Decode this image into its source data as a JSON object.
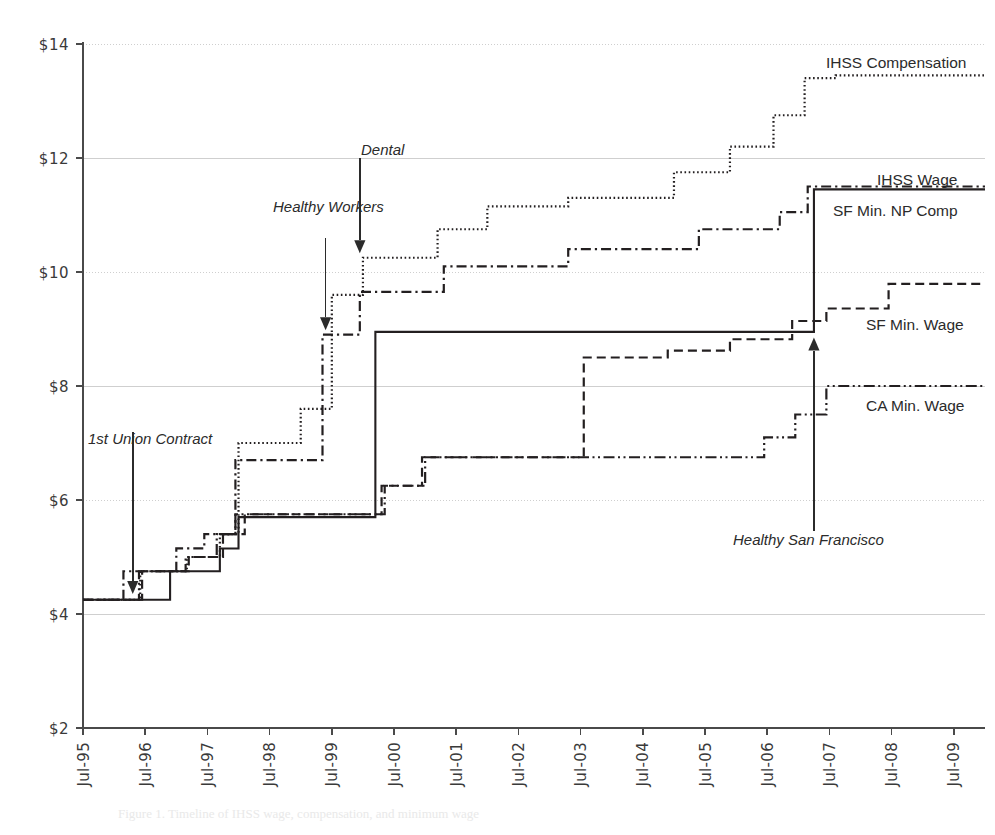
{
  "chart_data": {
    "type": "line",
    "title": "",
    "subtitle": "",
    "xlabel": "",
    "ylabel": "",
    "grid": true,
    "legend_position": "right-inline",
    "xlim": [
      "Jul-95",
      "Jul-10"
    ],
    "ylim": [
      2,
      14
    ],
    "ytick_labels": [
      "$14",
      "$12",
      "$10",
      "$8",
      "$6",
      "$4",
      "$2"
    ],
    "ytick_values": [
      14,
      12,
      10,
      8,
      6,
      4,
      2
    ],
    "xtick_labels": [
      "Jul-95",
      "Jul-96",
      "Jul-97",
      "Jul-98",
      "Jul-99",
      "Jul-00",
      "Jul-01",
      "Jul-02",
      "Jul-03",
      "Jul-04",
      "Jul-05",
      "Jul-06",
      "Jul-07",
      "Jul-08",
      "Jul-09"
    ],
    "xtick_values": [
      1995.5,
      1996.5,
      1997.5,
      1998.5,
      1999.5,
      2000.5,
      2001.5,
      2002.5,
      2003.5,
      2004.5,
      2005.5,
      2006.5,
      2007.5,
      2008.5,
      2009.5
    ],
    "series": [
      {
        "name": "IHSS Compensation",
        "label": "IHSS Compensation",
        "dash": "dotted",
        "color": "#231f20",
        "points": [
          [
            1995.5,
            4.25
          ],
          [
            1996.42,
            4.25
          ],
          [
            1996.42,
            4.75
          ],
          [
            1997.17,
            4.75
          ],
          [
            1997.17,
            5.0
          ],
          [
            1997.7,
            5.0
          ],
          [
            1997.7,
            5.4
          ],
          [
            1998.0,
            5.4
          ],
          [
            1998.0,
            7.0
          ],
          [
            1999.0,
            7.0
          ],
          [
            1999.0,
            7.6
          ],
          [
            1999.5,
            7.6
          ],
          [
            1999.5,
            9.6
          ],
          [
            2000.0,
            9.6
          ],
          [
            2000.0,
            10.25
          ],
          [
            2001.2,
            10.25
          ],
          [
            2001.2,
            10.75
          ],
          [
            2002.0,
            10.75
          ],
          [
            2002.0,
            11.15
          ],
          [
            2003.3,
            11.15
          ],
          [
            2003.3,
            11.3
          ],
          [
            2005.0,
            11.3
          ],
          [
            2005.0,
            11.75
          ],
          [
            2005.9,
            11.75
          ],
          [
            2005.9,
            12.2
          ],
          [
            2006.6,
            12.2
          ],
          [
            2006.6,
            12.75
          ],
          [
            2007.1,
            12.75
          ],
          [
            2007.1,
            13.4
          ],
          [
            2007.6,
            13.4
          ],
          [
            2007.6,
            13.45
          ],
          [
            2010.0,
            13.45
          ]
        ]
      },
      {
        "name": "IHSS Wage",
        "label": "IHSS Wage",
        "dash": "solid",
        "color": "#231f20",
        "points": [
          [
            1995.5,
            4.25
          ],
          [
            1996.9,
            4.25
          ],
          [
            1996.9,
            4.75
          ],
          [
            1997.7,
            4.75
          ],
          [
            1997.7,
            5.15
          ],
          [
            1998.0,
            5.15
          ],
          [
            1998.0,
            5.7
          ],
          [
            2000.2,
            5.7
          ],
          [
            2000.2,
            8.95
          ],
          [
            2007.25,
            8.95
          ],
          [
            2007.25,
            11.45
          ],
          [
            2010.0,
            11.45
          ]
        ]
      },
      {
        "name": "SF Min. NP Comp",
        "label": "SF Min. NP Comp",
        "dash": "dashdot",
        "color": "#231f20",
        "points": [
          [
            1995.5,
            4.25
          ],
          [
            1996.15,
            4.25
          ],
          [
            1996.15,
            4.75
          ],
          [
            1997.0,
            4.75
          ],
          [
            1997.0,
            5.15
          ],
          [
            1997.45,
            5.15
          ],
          [
            1997.45,
            5.4
          ],
          [
            1997.95,
            5.4
          ],
          [
            1997.95,
            6.7
          ],
          [
            1999.35,
            6.7
          ],
          [
            1999.35,
            8.9
          ],
          [
            1999.95,
            8.9
          ],
          [
            1999.95,
            9.65
          ],
          [
            2001.3,
            9.65
          ],
          [
            2001.3,
            10.1
          ],
          [
            2003.3,
            10.1
          ],
          [
            2003.3,
            10.4
          ],
          [
            2005.4,
            10.4
          ],
          [
            2005.4,
            10.75
          ],
          [
            2006.7,
            10.75
          ],
          [
            2006.7,
            11.05
          ],
          [
            2007.15,
            11.05
          ],
          [
            2007.15,
            11.5
          ],
          [
            2010.0,
            11.5
          ]
        ]
      },
      {
        "name": "SF Min. Wage",
        "label": "SF Min. Wage",
        "dash": "dashed",
        "color": "#231f20",
        "points": [
          [
            1995.5,
            4.25
          ],
          [
            1996.45,
            4.25
          ],
          [
            1996.45,
            4.75
          ],
          [
            1997.2,
            4.75
          ],
          [
            1997.2,
            5.0
          ],
          [
            1997.75,
            5.0
          ],
          [
            1997.75,
            5.4
          ],
          [
            1998.1,
            5.4
          ],
          [
            1998.1,
            5.75
          ],
          [
            2000.3,
            5.75
          ],
          [
            2000.3,
            6.25
          ],
          [
            2000.95,
            6.25
          ],
          [
            2000.95,
            6.75
          ],
          [
            2003.55,
            6.75
          ],
          [
            2003.55,
            8.5
          ],
          [
            2004.9,
            8.5
          ],
          [
            2004.9,
            8.62
          ],
          [
            2005.9,
            8.62
          ],
          [
            2005.9,
            8.82
          ],
          [
            2006.9,
            8.82
          ],
          [
            2006.9,
            9.14
          ],
          [
            2007.45,
            9.14
          ],
          [
            2007.45,
            9.36
          ],
          [
            2008.45,
            9.36
          ],
          [
            2008.45,
            9.79
          ],
          [
            2010.0,
            9.79
          ]
        ]
      },
      {
        "name": "CA Min. Wage",
        "label": "CA Min. Wage",
        "dash": "dashdotdot",
        "color": "#231f20",
        "points": [
          [
            1995.5,
            4.25
          ],
          [
            1996.4,
            4.25
          ],
          [
            1996.4,
            4.75
          ],
          [
            1997.15,
            4.75
          ],
          [
            1997.15,
            5.0
          ],
          [
            1997.65,
            5.0
          ],
          [
            1997.65,
            5.4
          ],
          [
            1997.95,
            5.4
          ],
          [
            1997.95,
            5.75
          ],
          [
            2000.35,
            5.75
          ],
          [
            2000.35,
            6.25
          ],
          [
            2001.0,
            6.25
          ],
          [
            2001.0,
            6.75
          ],
          [
            2006.45,
            6.75
          ],
          [
            2006.45,
            7.1
          ],
          [
            2006.95,
            7.1
          ],
          [
            2006.95,
            7.5
          ],
          [
            2007.45,
            7.5
          ],
          [
            2007.45,
            8.0
          ],
          [
            2010.0,
            8.0
          ]
        ]
      }
    ],
    "annotations": [
      {
        "label": "1st Union Contract",
        "text_x": 1996.0,
        "text_y": 7.55,
        "arrow_x": 1996.3,
        "arrow_from_y": 7.2,
        "arrow_to_y": 4.35,
        "direction": "down"
      },
      {
        "label": "Healthy Workers",
        "text_x": 1998.5,
        "text_y": 11.0,
        "arrow_x": 1999.4,
        "arrow_from_y": 10.6,
        "arrow_to_y": 8.98,
        "direction": "down"
      },
      {
        "label": "Dental",
        "text_x": 1999.35,
        "text_y": 12.35,
        "arrow_x": 1999.95,
        "arrow_from_y": 12.0,
        "arrow_to_y": 10.33,
        "direction": "down"
      },
      {
        "label": "Healthy San Francisco",
        "text_x": 2005.45,
        "text_y": 5.1,
        "arrow_x": 2007.25,
        "arrow_from_y": 5.45,
        "arrow_to_y": 8.85,
        "direction": "up"
      }
    ]
  },
  "caption": {
    "text": "Figure 1.    Timeline of IHSS wage, compensation, and minimum wage"
  }
}
